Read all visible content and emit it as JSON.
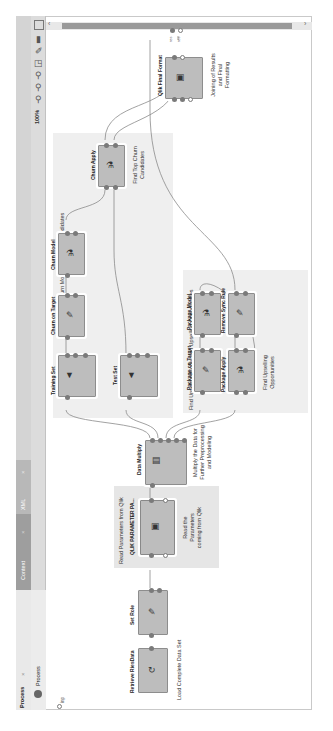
{
  "tabs": [
    {
      "label": "Process",
      "active": true
    },
    {
      "label": "Context",
      "active": false
    },
    {
      "label": "XML",
      "active": false
    }
  ],
  "breadcrumb": {
    "label": "Process",
    "arrow": "▸"
  },
  "toolbar": {
    "zoom_level": "100%",
    "icons": [
      "fit-window-icon",
      "page-icon",
      "auto-wire-icon",
      "arrange-icon",
      "zoom-in-icon",
      "zoom-out-icon",
      "zoom-reset-icon"
    ]
  },
  "canvas": {
    "input_port_label": "inp",
    "groups": [
      {
        "title": "Find Churn Model and Churn Candidates"
      },
      {
        "title": "Find Upselling Model and Upselling Opportunities"
      },
      {
        "title": "Read Parameters from Qlik"
      }
    ],
    "operators": [
      {
        "id": "retrieve",
        "name": "Retrieve RiesData",
        "note": "Load Complete Data Set"
      },
      {
        "id": "setrole",
        "name": "Set Role"
      },
      {
        "id": "qlikparam",
        "name": "QLIK PARAMETER PA...",
        "note": "Read the Parameters coming from Qlik"
      },
      {
        "id": "multiply",
        "name": "Data Multiply",
        "note": "Multiply the Data for Further Preprocessing and Modeling"
      },
      {
        "id": "training",
        "name": "Training Set"
      },
      {
        "id": "testset",
        "name": "Test Set"
      },
      {
        "id": "churntarget",
        "name": "Churn on Target"
      },
      {
        "id": "churnmodel",
        "name": "Churn Model"
      },
      {
        "id": "churnapply",
        "name": "Churn Apply",
        "note": "Find Top Churn Candidates"
      },
      {
        "id": "pkgtarget",
        "name": "Package on Target"
      },
      {
        "id": "pkgmodel",
        "name": "Package Model"
      },
      {
        "id": "pkgapply",
        "name": "Package Apply",
        "note": "Find Upselling Opportunities"
      },
      {
        "id": "removesyn",
        "name": "Remove Sync Rule"
      },
      {
        "id": "qlikfinal",
        "name": "Qlik Final Format",
        "note": "Joining of Results and Final Formatting"
      }
    ],
    "output_ports": [
      "res",
      "res"
    ]
  }
}
